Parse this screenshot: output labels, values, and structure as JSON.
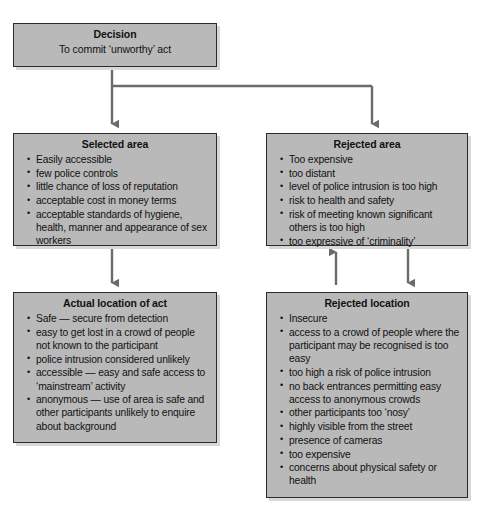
{
  "diagram": {
    "colors": {
      "box_fill": "#b9b9b9",
      "box_border": "#2b2b2b",
      "connector": "#6b6b6b",
      "page_background": "#ffffff",
      "text": "#111111"
    },
    "boxes": {
      "decision": {
        "title": "Decision",
        "subtitle": "To commit ‘unworthy’ act"
      },
      "selected_area": {
        "title": "Selected area",
        "items": [
          "Easily accessible",
          "few police controls",
          "little chance of loss of reputation",
          "acceptable cost in money terms",
          "acceptable standards of hygiene, health, manner and appearance of sex workers"
        ]
      },
      "rejected_area": {
        "title": "Rejected area",
        "items": [
          "Too expensive",
          "too distant",
          "level of police intrusion is too high",
          "risk to health and safety",
          "risk of meeting known significant others is too high",
          "too expressive of ‘criminality’"
        ]
      },
      "actual_location": {
        "title": "Actual location of act",
        "items": [
          "Safe — secure from detection",
          "easy to get lost in a crowd of people not known to the participant",
          "police intrusion considered unlikely",
          "accessible — easy and safe access to ‘mainstream’ activity",
          "anonymous — use of area is safe and other participants unlikely to enquire about background"
        ]
      },
      "rejected_location": {
        "title": "Rejected location",
        "items": [
          "Insecure",
          "access to a crowd of people where the participant may be recognised is too easy",
          "too high a risk of police intrusion",
          "no back entrances permitting easy access to anonymous crowds",
          "other participants too ‘nosy’",
          "highly visible from the street",
          "presence of cameras",
          "too expensive",
          "concerns about physical safety or health"
        ]
      }
    },
    "connectors": [
      {
        "name": "decision-to-selected-area",
        "direction": "down"
      },
      {
        "name": "decision-to-rejected-area",
        "direction": "down"
      },
      {
        "name": "selected-area-to-actual-location",
        "direction": "down"
      },
      {
        "name": "rejected-location-to-rejected-area",
        "direction": "up"
      },
      {
        "name": "rejected-area-to-rejected-location",
        "direction": "down"
      }
    ]
  }
}
